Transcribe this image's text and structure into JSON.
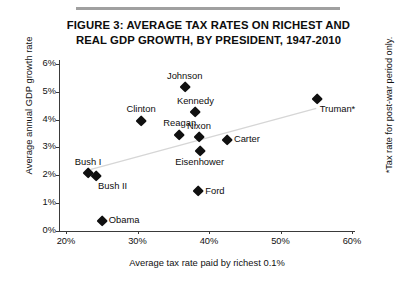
{
  "figure": {
    "title_line1": "FIGURE 3: AVERAGE TAX RATES ON RICHEST AND",
    "title_line2": "REAL GDP GROWTH, BY PRESIDENT, 1947-2010",
    "footnote": "*Tax rate for post-war period only."
  },
  "chart_data": {
    "type": "scatter",
    "title": "FIGURE 3: AVERAGE TAX RATES ON RICHEST AND REAL GDP GROWTH, BY PRESIDENT, 1947-2010",
    "xlabel": "Average tax rate paid by richest 0.1%",
    "ylabel": "Average annual GDP growth rate",
    "xlim": [
      20,
      60
    ],
    "ylim": [
      0,
      6
    ],
    "xticks": [
      "20%",
      "30%",
      "40%",
      "50%",
      "60%"
    ],
    "yticks": [
      "0%",
      "1%",
      "2%",
      "3%",
      "4%",
      "5%",
      "6%"
    ],
    "grid": false,
    "legend": "none",
    "marker": "black-diamond",
    "trendline": {
      "visible": true,
      "note": "faint upward-sloping fit line",
      "x_start": 23.5,
      "y_start": 2.2,
      "x_end": 55.0,
      "y_end": 4.4
    },
    "points": [
      {
        "label": "Obama",
        "x": 25.0,
        "y": 0.35,
        "label_pos": "right"
      },
      {
        "label": "Bush I",
        "x": 23.1,
        "y": 2.05,
        "label_pos": "top"
      },
      {
        "label": "Bush II",
        "x": 24.2,
        "y": 1.95,
        "label_pos": "bottomright"
      },
      {
        "label": "Clinton",
        "x": 30.5,
        "y": 3.95,
        "label_pos": "top"
      },
      {
        "label": "Reagan",
        "x": 35.9,
        "y": 3.45,
        "label_pos": "top"
      },
      {
        "label": "Johnson",
        "x": 36.6,
        "y": 5.15,
        "label_pos": "top"
      },
      {
        "label": "Kennedy",
        "x": 38.1,
        "y": 4.25,
        "label_pos": "top"
      },
      {
        "label": "Nixon",
        "x": 38.6,
        "y": 3.35,
        "label_pos": "top"
      },
      {
        "label": "Eisenhower",
        "x": 38.7,
        "y": 2.85,
        "label_pos": "bottom"
      },
      {
        "label": "Ford",
        "x": 38.5,
        "y": 1.4,
        "label_pos": "right"
      },
      {
        "label": "Carter",
        "x": 42.5,
        "y": 3.25,
        "label_pos": "right"
      },
      {
        "label": "Truman*",
        "x": 55.2,
        "y": 4.75,
        "label_pos": "bottomright"
      }
    ]
  }
}
